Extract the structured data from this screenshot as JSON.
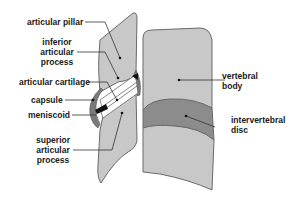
{
  "diagram": {
    "type": "anatomical-illustration",
    "colors": {
      "bone_fill": "#c8c8c8",
      "bone_stroke": "#6a6a6a",
      "disc_fill": "#8c8c8c",
      "capsule_fill": "#7a7a7a",
      "cartilage_fill": "#ffffff",
      "meniscoid_fill": "#111111",
      "leader_line": "#333333",
      "label_text": "#1a1a1a"
    },
    "labels": {
      "articular_pillar": "articular pillar",
      "inferior_articular_process_l1": "inferior",
      "inferior_articular_process_l2": "articular",
      "inferior_articular_process_l3": "process",
      "articular_cartilage": "articular cartilage",
      "capsule": "capsule",
      "meniscoid": "meniscoid",
      "superior_articular_process_l1": "superior",
      "superior_articular_process_l2": "articular",
      "superior_articular_process_l3": "process",
      "vertebral_body_l1": "vertebral",
      "vertebral_body_l2": "body",
      "intervertebral_disc_l1": "intervertebral",
      "intervertebral_disc_l2": "disc"
    }
  }
}
